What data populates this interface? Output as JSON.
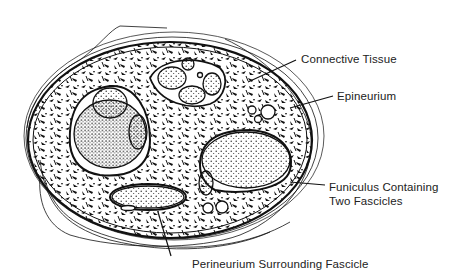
{
  "diagram": {
    "labels": [
      {
        "id": "connective-tissue",
        "text": "Connective Tissue"
      },
      {
        "id": "epineurium",
        "text": "Epineurium"
      },
      {
        "id": "funiculus",
        "line1": "Funiculus Containing",
        "line2": "Two Fascicles"
      },
      {
        "id": "perineurium",
        "text": "Perineurium Surrounding Fascicle"
      }
    ],
    "colors": {
      "ink": "#111111",
      "background": "#ffffff",
      "text": "#222222"
    }
  }
}
